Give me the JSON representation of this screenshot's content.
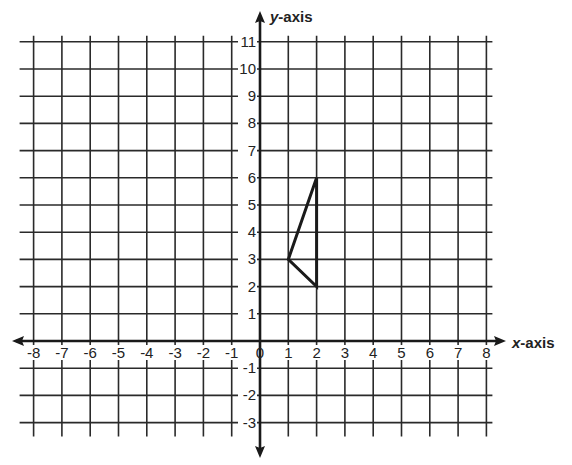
{
  "chart_data": {
    "type": "scatter",
    "title": "",
    "xlabel": "x-axis",
    "ylabel": "y-axis",
    "xlim": [
      -8,
      8
    ],
    "ylim": [
      -3,
      11
    ],
    "grid": true,
    "x_ticks": [
      -8,
      -7,
      -6,
      -5,
      -4,
      -3,
      -2,
      -1,
      0,
      1,
      2,
      3,
      4,
      5,
      6,
      7,
      8
    ],
    "y_ticks": [
      -3,
      -2,
      -1,
      1,
      2,
      3,
      4,
      5,
      6,
      7,
      8,
      9,
      10,
      11
    ],
    "shapes": [
      {
        "name": "triangle",
        "vertices": [
          [
            1,
            3
          ],
          [
            2,
            6
          ],
          [
            2,
            2
          ]
        ],
        "closed": true
      }
    ]
  },
  "labels": {
    "x_axis_var": "x",
    "x_axis_suffix": "-axis",
    "y_axis_var": "y",
    "y_axis_suffix": "-axis"
  },
  "colors": {
    "grid": "#2a2a2a",
    "axis": "#1a1a1a",
    "shape": "#1a1a1a",
    "tick_label": "#222222"
  }
}
